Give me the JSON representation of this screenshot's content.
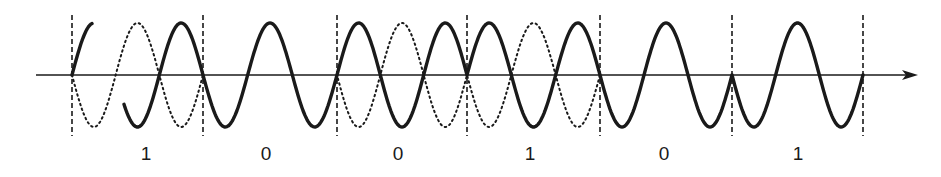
{
  "title": "",
  "diagram": {
    "type": "phase-shift-keying waveform",
    "axis": {
      "y": 75,
      "x_start": 36,
      "x_end": 918,
      "arrow": true,
      "color": "#1a1a1a"
    },
    "bit_boundaries_x": [
      72,
      203,
      337,
      467,
      600,
      732,
      863
    ],
    "bits": [
      "1",
      "0",
      "0",
      "1",
      "0",
      "1"
    ],
    "bit_label_x": [
      146,
      266,
      398,
      530,
      664,
      798
    ],
    "carrier": {
      "amplitude": 52,
      "period": 87.5,
      "cycles_per_bit": 1.5
    },
    "signal_phase_per_bit": [
      0,
      1,
      0,
      0,
      1,
      1
    ],
    "legend": [
      {
        "style": "solid",
        "meaning": "modulated signal"
      },
      {
        "style": "dotted",
        "meaning": "reference carrier"
      }
    ],
    "colors": {
      "ink": "#1a1a1a",
      "background": "#ffffff"
    }
  }
}
